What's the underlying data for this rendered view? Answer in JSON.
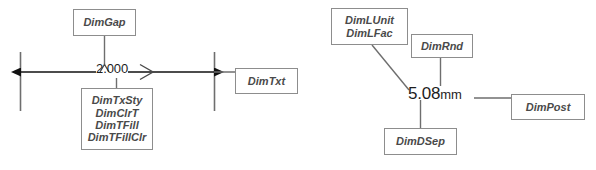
{
  "diagram": {
    "colors": {
      "background": "#ffffff",
      "box_border": "#8d8d8d",
      "box_text": "#4a4a4a",
      "line": "#6e6e6e",
      "dimension_line": "#111111",
      "value_text": "#1d1d1d"
    },
    "left": {
      "name": "imperial-dimension-example",
      "dimension_value": "2.000",
      "gap_marker": "^",
      "arrow_glyph": ">",
      "nodes": [
        {
          "id": "dimgap",
          "lines": [
            "DimGap"
          ]
        },
        {
          "id": "dimtxsty",
          "lines": [
            "DimTxSty",
            "DimClrT",
            "DimTFill",
            "DimTFillClr"
          ]
        },
        {
          "id": "dimtxt",
          "lines": [
            "DimTxt"
          ]
        }
      ]
    },
    "right": {
      "name": "metric-dimension-example",
      "dimension_number": "5.08",
      "dimension_unit": "mm",
      "nodes": [
        {
          "id": "dimlunit",
          "lines": [
            "DimLUnit",
            "DimLFac"
          ]
        },
        {
          "id": "dimrnd",
          "lines": [
            "DimRnd"
          ]
        },
        {
          "id": "dimpost",
          "lines": [
            "DimPost"
          ]
        },
        {
          "id": "dimdsep",
          "lines": [
            "DimDSep"
          ]
        }
      ]
    }
  }
}
